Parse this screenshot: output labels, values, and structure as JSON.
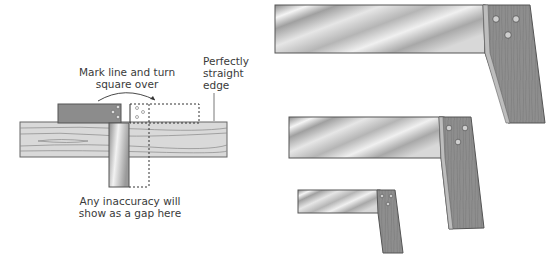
{
  "diagram": {
    "test_illustration": {
      "label_mark_line": [
        "Mark line and turn",
        "square over"
      ],
      "label_straight_edge": [
        "Perfectly",
        "straight",
        "edge"
      ],
      "label_gap": [
        "Any inaccuracy will",
        "show as a gap here"
      ]
    },
    "squares": [
      {
        "size": "large"
      },
      {
        "size": "medium"
      },
      {
        "size": "small"
      }
    ],
    "colors": {
      "steel_light": "#f2f2f2",
      "steel_dark": "#9a9a9a",
      "wood": "#8a8a8a",
      "board": "#d6d6d6",
      "outline": "#555555"
    }
  }
}
